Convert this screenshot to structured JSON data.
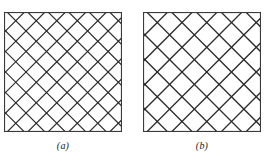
{
  "figure": {
    "type": "diagram",
    "background_color": "#ffffff",
    "line_color": "#2b2b2b",
    "frame_color": "#3a3a3a",
    "panels": [
      {
        "id": "panel-a",
        "caption": "(a)",
        "x": 4,
        "y": 12,
        "width": 118,
        "height": 120,
        "frame_width": 1.1,
        "hatch": {
          "angle_deg": 45,
          "spacing": 14.5,
          "line_width": 1.2,
          "directions": [
            "up-right",
            "down-right"
          ]
        },
        "caption_y": 140
      },
      {
        "id": "panel-b",
        "caption": "(b)",
        "x": 143,
        "y": 12,
        "width": 118,
        "height": 120,
        "frame_width": 1.1,
        "hatch": {
          "angle_deg": 45,
          "spacing": 17.5,
          "line_width": 1.3,
          "directions": [
            "up-right",
            "down-right"
          ]
        },
        "caption_y": 140
      }
    ]
  }
}
